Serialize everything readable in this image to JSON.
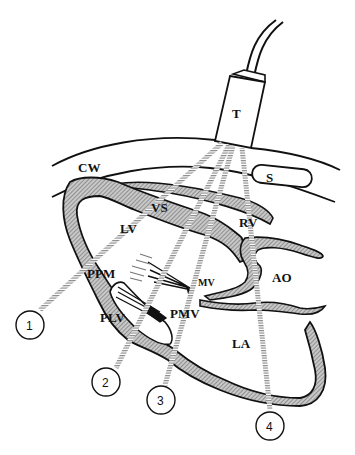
{
  "diagram": {
    "type": "echocardiography-transducer-views",
    "transducer": {
      "label": "T"
    },
    "structures": {
      "chest_wall": "CW",
      "sternum": "S",
      "ventricular_septum": "VS",
      "left_ventricle": "LV",
      "right_ventricle": "RV",
      "aorta": "AO",
      "mitral_valve": "MV",
      "posterior_papillary_muscle": "PPM",
      "posterior_mitral_leaflet": "PMV",
      "posterior_lv_wall": "PLV",
      "left_atrium": "LA"
    },
    "beams": [
      {
        "id": "1",
        "label": "1"
      },
      {
        "id": "2",
        "label": "2"
      },
      {
        "id": "3",
        "label": "3"
      },
      {
        "id": "4",
        "label": "4"
      }
    ]
  },
  "colors": {
    "outline": "#111111",
    "tissue_fill": "#a8a8a8",
    "beam": "#9a9a9a",
    "background": "#ffffff"
  }
}
